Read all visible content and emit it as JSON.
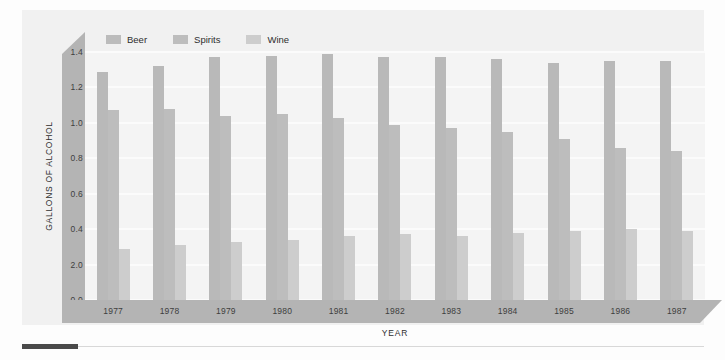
{
  "chart_data": {
    "type": "bar",
    "title": "",
    "xlabel": "YEAR",
    "ylabel": "GALLONS OF ALCOHOL",
    "categories": [
      "1977",
      "1978",
      "1979",
      "1980",
      "1981",
      "1982",
      "1983",
      "1984",
      "1985",
      "1986",
      "1987"
    ],
    "series": [
      {
        "name": "Beer",
        "values": [
          1.29,
          1.32,
          1.37,
          1.38,
          1.39,
          1.37,
          1.37,
          1.36,
          1.34,
          1.35,
          1.35
        ]
      },
      {
        "name": "Spirits",
        "values": [
          1.07,
          1.08,
          1.04,
          1.05,
          1.03,
          0.99,
          0.97,
          0.95,
          0.91,
          0.86,
          0.84
        ]
      },
      {
        "name": "Wine",
        "values": [
          0.29,
          0.31,
          0.33,
          0.34,
          0.36,
          0.37,
          0.36,
          0.38,
          0.39,
          0.4,
          0.39
        ]
      }
    ],
    "ylim": [
      0.0,
      1.4
    ],
    "ytick_labels": [
      "1.4",
      "1.2",
      "1.0",
      "0.8",
      "0.6",
      "0.4",
      "2.0",
      "0.0"
    ],
    "ytick_values": [
      1.4,
      1.2,
      1.0,
      0.8,
      0.6,
      0.4,
      0.2,
      0.0
    ],
    "grid": true,
    "legend_position": "top-left",
    "colors": {
      "beer": "#b9b9b9",
      "spirits": "#bdbdbd",
      "wine": "#cdcdcd",
      "axis_band": "#b4b4b4",
      "plot_background": "#f4f4f4",
      "panel_background": "#f1f1f1",
      "gridline": "#fbfbfb",
      "rule_dark": "#4a4a4a"
    }
  },
  "legend": {
    "items": [
      {
        "label": "Beer"
      },
      {
        "label": "Spirits"
      },
      {
        "label": "Wine"
      }
    ]
  }
}
